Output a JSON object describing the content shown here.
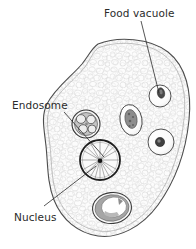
{
  "figure": {
    "type": "labeled-biological-illustration",
    "background_color": "#ffffff",
    "ink_color": "#2b2b2b",
    "cytoplasm_color": "#fbfbfb",
    "granule_color": "#c9c9c9",
    "membrane_color": "#555555"
  },
  "labels": {
    "food_vacuole": "Food vacuole",
    "endosome": "Endosome",
    "nucleus": "Nucleus"
  },
  "label_positions": {
    "food_vacuole": {
      "x": 104,
      "y": 16,
      "anchor": "start"
    },
    "endosome": {
      "x": 12,
      "y": 108,
      "anchor": "start"
    },
    "nucleus": {
      "x": 12,
      "y": 218,
      "anchor": "start"
    }
  },
  "leader_lines": {
    "food_vacuole": {
      "x1": 141,
      "y1": 21,
      "x2": 159,
      "y2": 93
    },
    "endosome": {
      "x1": 64,
      "y1": 112,
      "x2": 104,
      "y2": 157
    },
    "nucleus": {
      "x1": 44,
      "y1": 206,
      "x2": 96,
      "y2": 166
    }
  },
  "organelles": [
    {
      "name": "food-vacuole-upper-right",
      "shape": "circle",
      "cx": 160,
      "cy": 96,
      "r": 11,
      "inclusion": {
        "cx": 161,
        "cy": 93,
        "rx": 3.5,
        "ry": 5,
        "fill": "#4a4a4a"
      }
    },
    {
      "name": "food-vacuole-middle",
      "shape": "ellipse",
      "cx": 131,
      "cy": 120,
      "rx": 11,
      "ry": 15,
      "inclusion": {
        "cx": 131,
        "cy": 119,
        "rx": 6,
        "ry": 9,
        "fill": "#7d7d7d"
      }
    },
    {
      "name": "food-vacuole-right",
      "shape": "circle",
      "cx": 161,
      "cy": 142,
      "r": 13,
      "inclusion": {
        "cx": 160,
        "cy": 142,
        "rx": 4.5,
        "ry": 4.5,
        "fill": "#3f3f3f"
      }
    },
    {
      "name": "endosome-vacuole",
      "shape": "circle",
      "cx": 86,
      "cy": 124,
      "r": 14,
      "inclusion": {
        "lobes": 4,
        "fill": "#b5b5b5"
      }
    },
    {
      "name": "nucleus",
      "shape": "circle",
      "cx": 100,
      "cy": 160,
      "r": 20,
      "spokes": 18,
      "karyosome": {
        "cx": 100,
        "cy": 161,
        "r": 2.2,
        "fill": "#1c1c1c"
      }
    },
    {
      "name": "contractile-vacuole-lower",
      "shape": "ellipse",
      "cx": 112,
      "cy": 208,
      "rx": 19,
      "ry": 15,
      "inclusion": {
        "crescent": true,
        "fill": "#9a9a9a"
      }
    }
  ],
  "cell": {
    "name": "amoeba-cell-body",
    "outline_path": "M 98 44 C 118 36, 150 38, 168 52 C 186 66, 192 92, 189 120 C 186 150, 176 180, 158 205 C 142 227, 118 239, 98 236 C 78 233, 62 220, 54 200 C 47 182, 48 164, 46 146 C 44 128, 41 116, 47 104 C 55 88, 72 76, 82 64 C 89 55, 92 48, 98 44 Z"
  }
}
